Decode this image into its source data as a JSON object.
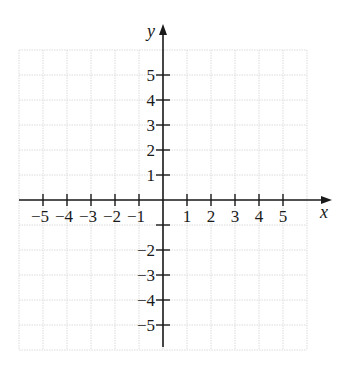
{
  "chart_data": {
    "type": "coordinate-grid",
    "title": "",
    "xlabel": "x",
    "ylabel": "y",
    "xlim": [
      -6,
      6
    ],
    "ylim": [
      -6,
      6
    ],
    "grid": true,
    "grid_step": 1,
    "x_ticks": [
      -5,
      -4,
      -3,
      -2,
      -1,
      1,
      2,
      3,
      4,
      5
    ],
    "x_tick_labels": [
      "−5",
      "−4",
      "−3",
      "−2",
      "−1",
      "1",
      "2",
      "3",
      "4",
      "5"
    ],
    "y_ticks": [
      5,
      4,
      3,
      2,
      1,
      -1,
      -2,
      -3,
      -4,
      -5
    ],
    "y_tick_labels": [
      "5",
      "4",
      "3",
      "2",
      "1",
      "",
      "−2",
      "−3",
      "−4",
      "−5"
    ],
    "series": []
  },
  "colors": {
    "axis": "#1a1a1a",
    "grid": "#dcdcdc",
    "background": "#ffffff"
  }
}
